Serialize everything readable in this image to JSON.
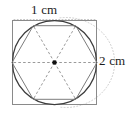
{
  "figure": {
    "name": "square-circle-hexagon-dimensioned-figure",
    "labels": {
      "top": "1 cm",
      "right": "2 cm"
    },
    "colors": {
      "square_stroke": "#8a8a8a",
      "circle_stroke": "#3a3a3a",
      "hexagon_stroke": "#7a7a7a",
      "radius_dash_stroke": "#9a9a9a",
      "center_dot": "#111111",
      "dimension_guide": "#c8c8c8",
      "text": "#1c1c1c",
      "background": "#ffffff"
    },
    "geometry": {
      "square": {
        "x": 12,
        "y": 20,
        "width": 85,
        "height": 85
      },
      "circle": {
        "cx": 54.5,
        "cy": 62.5,
        "r": 42.5
      },
      "hexagon_vertices": [
        {
          "x": 97.0,
          "y": 62.5
        },
        {
          "x": 75.75,
          "y": 25.7
        },
        {
          "x": 33.25,
          "y": 25.7
        },
        {
          "x": 12.0,
          "y": 62.5
        },
        {
          "x": 33.25,
          "y": 99.3
        },
        {
          "x": 75.75,
          "y": 99.3
        }
      ],
      "center_dot": {
        "cx": 54.5,
        "cy": 62.5,
        "r": 2.3
      },
      "top_dimension_line": {
        "x1": 14,
        "y1": 19.5,
        "x2": 95,
        "y2": 19.5
      },
      "right_dimension_arc": {
        "cx": 54.5,
        "cy": 62.5,
        "rx": 49,
        "ry": 45
      }
    },
    "measurements": {
      "hexagon_side_label": "1 cm",
      "circle_diameter_label": "2 cm"
    }
  }
}
